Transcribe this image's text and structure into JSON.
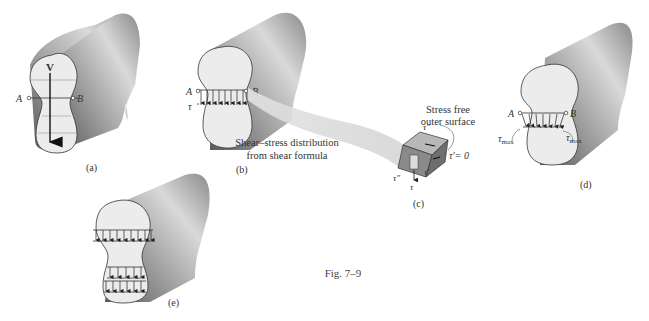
{
  "figure": {
    "caption": "Fig. 7–9",
    "panels": {
      "a": {
        "label": "(a)",
        "force_label": "V",
        "point_a": "A",
        "point_b": "B"
      },
      "b": {
        "label": "(b)",
        "point_a": "A",
        "point_b": "B",
        "stress_label": "τ",
        "description_line1": "Shear–stress distribution",
        "description_line2": "from shear formula"
      },
      "c": {
        "label": "(c)",
        "note_line1": "Stress free",
        "note_line2": "outer surface",
        "tau_double_prime_top": "τ″",
        "tau_prime_zero": "τ′= 0",
        "tau_prime": "τ′",
        "tau_double_prime_left": "τ″",
        "tau": "τ"
      },
      "d": {
        "label": "(d)",
        "point_a": "A",
        "point_b": "B",
        "tau_max_left": "τ",
        "tau_max_left_sub": "max",
        "tau_max_right": "τ",
        "tau_max_right_sub": "max"
      },
      "e": {
        "label": "(e)"
      }
    }
  },
  "colors": {
    "face": "#ececec",
    "body_dark": "#6e6e6e",
    "body_mid": "#a9a9a9",
    "body_light": "#d8d8d8",
    "outline": "#333333",
    "band": "#dcdcdc"
  }
}
